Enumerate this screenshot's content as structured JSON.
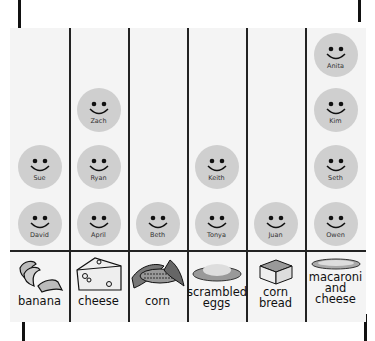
{
  "chart_data": {
    "type": "pictograph",
    "title": "",
    "xlabel": "Favorite food",
    "ylabel": "Number of students",
    "categories": [
      "banana",
      "cheese",
      "corn",
      "scrambled eggs",
      "corn bread",
      "macaroni and cheese"
    ],
    "values": [
      2,
      3,
      1,
      2,
      1,
      4
    ],
    "names": [
      [
        "David",
        "Sue"
      ],
      [
        "April",
        "Ryan",
        "Zach"
      ],
      [
        "Beth"
      ],
      [
        "Tonya",
        "Keith"
      ],
      [
        "Juan"
      ],
      [
        "Owen",
        "Seth",
        "Kim",
        "Anita"
      ]
    ],
    "symbol": "smiley-face (1 per student)",
    "grid": true,
    "legend": "none"
  },
  "columns": [
    {
      "label_lines": [
        "banana"
      ],
      "icon": "banana-icon",
      "people": [
        "David",
        "Sue"
      ]
    },
    {
      "label_lines": [
        "cheese"
      ],
      "icon": "cheese-icon",
      "people": [
        "April",
        "Ryan",
        "Zach"
      ]
    },
    {
      "label_lines": [
        "corn"
      ],
      "icon": "corn-icon",
      "people": [
        "Beth"
      ]
    },
    {
      "label_lines": [
        "scrambled",
        "eggs"
      ],
      "icon": "scrambled-eggs-icon",
      "people": [
        "Tonya",
        "Keith"
      ]
    },
    {
      "label_lines": [
        "corn",
        "bread"
      ],
      "icon": "corn-bread-icon",
      "people": [
        "Juan"
      ]
    },
    {
      "label_lines": [
        "macaroni",
        "and",
        "cheese"
      ],
      "icon": "macaroni-icon",
      "people": [
        "Owen",
        "Seth",
        "Kim",
        "Anita"
      ]
    }
  ],
  "colors": {
    "face": "#cfcfcf",
    "paper": "#f4f4f4",
    "lines": "#222222"
  }
}
